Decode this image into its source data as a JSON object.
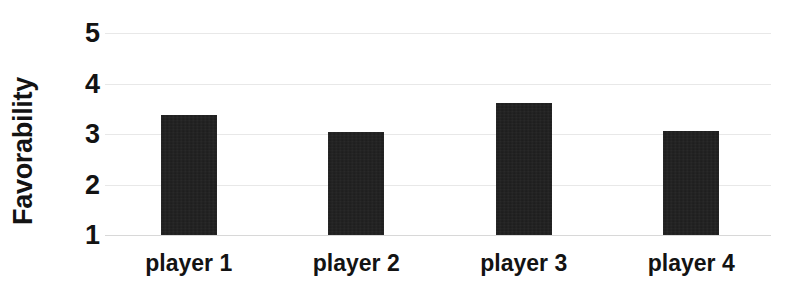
{
  "chart_data": {
    "type": "bar",
    "title": "",
    "xlabel": "",
    "ylabel": "Favorability",
    "categories": [
      "player 1",
      "player 2",
      "player 3",
      "player 4"
    ],
    "values": [
      3.38,
      3.04,
      3.61,
      3.06
    ],
    "ylim": [
      1,
      5
    ],
    "yticks": [
      1,
      2,
      3,
      4,
      5
    ],
    "ytick_labels": [
      "1",
      "2",
      "3",
      "4",
      "5"
    ],
    "grid": true,
    "grid_axis": "y",
    "legend": false,
    "legend_position": "none",
    "series": [
      {
        "name": "Favorability",
        "values": [
          3.38,
          3.04,
          3.61,
          3.06
        ]
      }
    ],
    "colors": {
      "bar": "#1b1b1b",
      "background": "#ffffff",
      "gridline": "#e8e8e8",
      "text": "#131313"
    }
  }
}
